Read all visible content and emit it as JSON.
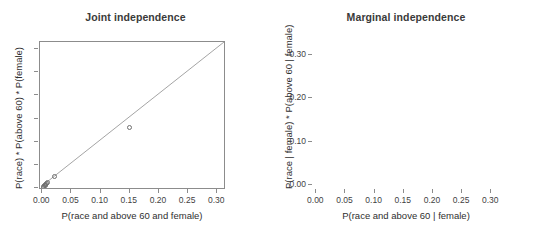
{
  "chart_data": [
    {
      "type": "scatter",
      "panel_id": "joint-independence",
      "title": "Joint independence",
      "xlabel": "P(race and above 60 and female)",
      "ylabel": "P(race) * P(above 60) * P(female)",
      "xlim": [
        -0.004,
        0.315
      ],
      "ylim": [
        -0.004,
        0.315
      ],
      "grid": false,
      "legend": "none",
      "reference_line": {
        "type": "identity",
        "label": "y = x",
        "from": [
          0.0,
          0.0
        ],
        "to": [
          0.315,
          0.315
        ]
      },
      "xticks": [
        0.0,
        0.05,
        0.1,
        0.15,
        0.2,
        0.25,
        0.3
      ],
      "xticklabels": [
        "0.00",
        "0.05",
        "0.10",
        "0.15",
        "0.20",
        "0.25",
        "0.30"
      ],
      "yticks": [
        0.0,
        0.05,
        0.1,
        0.15,
        0.2,
        0.25,
        0.3
      ],
      "yticklabels": [
        "",
        "",
        "",
        "",
        "",
        "",
        ""
      ],
      "marker": "open-circle",
      "points": [
        {
          "x": 0.0015,
          "y": 0.002
        },
        {
          "x": 0.0025,
          "y": 0.0035
        },
        {
          "x": 0.0035,
          "y": 0.0048
        },
        {
          "x": 0.0048,
          "y": 0.0062
        },
        {
          "x": 0.006,
          "y": 0.0078
        },
        {
          "x": 0.0075,
          "y": 0.0095
        },
        {
          "x": 0.009,
          "y": 0.0112
        },
        {
          "x": 0.021,
          "y": 0.026
        },
        {
          "x": 0.15,
          "y": 0.131
        }
      ]
    },
    {
      "type": "scatter",
      "panel_id": "marginal-independence",
      "title": "Marginal independence",
      "xlabel": "P(race and above 60 | female)",
      "ylabel": "P(race | female) * P(above 60 | female)",
      "xlim": [
        -0.004,
        0.315
      ],
      "ylim": [
        -0.012,
        0.33
      ],
      "grid": false,
      "legend": "none",
      "reference_line": {
        "type": "identity",
        "label": "y = x",
        "from": [
          0.0,
          0.0
        ],
        "to": [
          0.315,
          0.315
        ]
      },
      "xticks": [
        0.0,
        0.05,
        0.1,
        0.15,
        0.2,
        0.25,
        0.3
      ],
      "xticklabels": [
        "0.00",
        "0.05",
        "0.10",
        "0.15",
        "0.20",
        "0.25",
        "0.30"
      ],
      "yticks": [
        0.0,
        0.1,
        0.2,
        0.3
      ],
      "yticklabels": [
        "0.00",
        "0.10",
        "0.20",
        "0.30"
      ],
      "marker": "open-circle",
      "points": [
        {
          "x": 0.002,
          "y": 0.0025
        },
        {
          "x": 0.0035,
          "y": 0.005
        },
        {
          "x": 0.005,
          "y": 0.0075
        },
        {
          "x": 0.0065,
          "y": 0.01
        },
        {
          "x": 0.008,
          "y": 0.0125
        },
        {
          "x": 0.0095,
          "y": 0.015
        },
        {
          "x": 0.034,
          "y": 0.049
        },
        {
          "x": 0.275,
          "y": 0.243
        }
      ]
    }
  ],
  "style": {
    "frame_color": "#8c8c8c",
    "marker_color": "#6f6f6f",
    "line_color": "#9a9a9a",
    "text_color": "#3f3f3f",
    "title_color": "#3a3a3a",
    "background": "#ffffff"
  }
}
